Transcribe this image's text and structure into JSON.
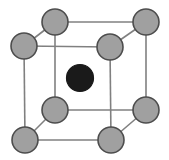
{
  "figure": {
    "background_color": "#FFFFFF",
    "width": 169,
    "height": 160
  },
  "style": {
    "edge_color": "#808080",
    "edge_width": 1.6,
    "corner_atom_fill": "#A0A0A0",
    "corner_atom_stroke": "#4D4D4D",
    "corner_atom_radius": 13,
    "center_atom_fill": "#1A1A1A",
    "center_atom_stroke": "#1A1A1A",
    "center_atom_radius": 13.5
  },
  "cube": {
    "front_face": {
      "label": "front-face",
      "top_left": {
        "x": 24,
        "y": 46
      },
      "top_right": {
        "x": 110,
        "y": 47
      },
      "bottom_right": {
        "x": 111,
        "y": 140
      },
      "bottom_left": {
        "x": 25,
        "y": 140
      }
    },
    "back_face": {
      "label": "back-face",
      "top_left": {
        "x": 55,
        "y": 22
      },
      "top_right": {
        "x": 146,
        "y": 22
      },
      "bottom_right": {
        "x": 146,
        "y": 110
      },
      "bottom_left": {
        "x": 55,
        "y": 110
      }
    },
    "edges": [
      {
        "name": "front-top",
        "x1": 24,
        "y1": 46,
        "x2": 110,
        "y2": 47
      },
      {
        "name": "front-right",
        "x1": 110,
        "y1": 47,
        "x2": 111,
        "y2": 140
      },
      {
        "name": "front-bottom",
        "x1": 111,
        "y1": 140,
        "x2": 25,
        "y2": 140
      },
      {
        "name": "front-left",
        "x1": 25,
        "y1": 140,
        "x2": 24,
        "y2": 46
      },
      {
        "name": "back-top",
        "x1": 55,
        "y1": 22,
        "x2": 146,
        "y2": 22
      },
      {
        "name": "back-right",
        "x1": 146,
        "y1": 22,
        "x2": 146,
        "y2": 110
      },
      {
        "name": "back-bottom",
        "x1": 146,
        "y1": 110,
        "x2": 55,
        "y2": 110
      },
      {
        "name": "back-left",
        "x1": 55,
        "y1": 110,
        "x2": 55,
        "y2": 22
      },
      {
        "name": "depth-top-left",
        "x1": 24,
        "y1": 46,
        "x2": 55,
        "y2": 22
      },
      {
        "name": "depth-top-right",
        "x1": 110,
        "y1": 47,
        "x2": 146,
        "y2": 22
      },
      {
        "name": "depth-bottom-left",
        "x1": 25,
        "y1": 140,
        "x2": 55,
        "y2": 110
      },
      {
        "name": "depth-bottom-right",
        "x1": 111,
        "y1": 140,
        "x2": 146,
        "y2": 110
      }
    ]
  },
  "atoms": {
    "corner": [
      {
        "id": "front-top-left",
        "x": 24,
        "y": 46,
        "r": 13,
        "fill": "#A0A0A0"
      },
      {
        "id": "front-top-right",
        "x": 110,
        "y": 47,
        "r": 13,
        "fill": "#A0A0A0"
      },
      {
        "id": "front-bottom-left",
        "x": 25,
        "y": 140,
        "r": 13,
        "fill": "#A0A0A0"
      },
      {
        "id": "front-bottom-right",
        "x": 111,
        "y": 140,
        "r": 13,
        "fill": "#A0A0A0"
      },
      {
        "id": "back-top-left",
        "x": 55,
        "y": 22,
        "r": 13,
        "fill": "#A0A0A0"
      },
      {
        "id": "back-top-right",
        "x": 146,
        "y": 22,
        "r": 13,
        "fill": "#A0A0A0"
      },
      {
        "id": "back-bottom-left",
        "x": 55,
        "y": 110,
        "r": 13,
        "fill": "#A0A0A0"
      },
      {
        "id": "back-bottom-right",
        "x": 146,
        "y": 110,
        "r": 13,
        "fill": "#A0A0A0"
      }
    ],
    "center": {
      "id": "body-center",
      "x": 80,
      "y": 78,
      "r": 13.5,
      "fill": "#1A1A1A"
    }
  }
}
